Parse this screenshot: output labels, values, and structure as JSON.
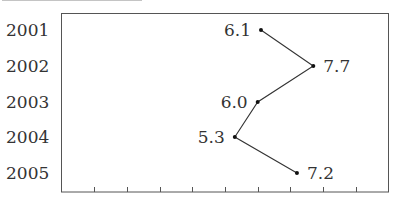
{
  "chart_data": {
    "type": "line",
    "title": "",
    "title_cropped": true,
    "orientation": "horizontal",
    "categories": [
      "2001",
      "2002",
      "2003",
      "2004",
      "2005"
    ],
    "values": [
      6.1,
      7.7,
      6.0,
      5.3,
      7.2
    ],
    "data_labels": [
      "6.1",
      "7.7",
      "6.0",
      "5.3",
      "7.2"
    ],
    "xlabel": "",
    "ylabel": "",
    "xlim": [
      0,
      10
    ],
    "x_ticks": [
      1,
      2,
      3,
      4,
      5,
      6,
      7,
      8,
      9
    ],
    "x_tick_labels_visible": false,
    "grid": false,
    "legend": null,
    "colors": {
      "line": "#333333",
      "marker": "#111111",
      "axis": "#555555"
    }
  }
}
